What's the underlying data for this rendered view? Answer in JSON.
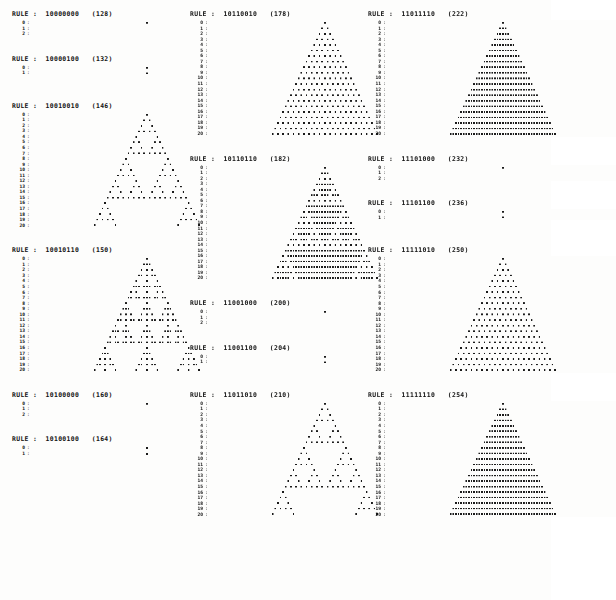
{
  "page": {
    "label_prefix": "RULE :",
    "background_color": "#fdfdfc",
    "cell_color": "#1a1a1a",
    "rows": 21,
    "row_labels": [
      "0",
      "1",
      "2",
      "3",
      "4",
      "5",
      "6",
      "7",
      "8",
      "9",
      "10",
      "11",
      "12",
      "13",
      "14",
      "15",
      "16",
      "17",
      "18",
      "19",
      "20"
    ],
    "gutter_separator": ":"
  },
  "columns": [
    {
      "name": "column-left",
      "blocks": [
        {
          "header": "RULE :  10000000   (128)",
          "binary": "10000000",
          "decimal": 128,
          "rows_shown": 3,
          "grid_width": 88,
          "cell_px": 2.6,
          "spacer_after": "md"
        },
        {
          "header": "RULE :  10000100   (132)",
          "binary": "10000100",
          "decimal": 132,
          "rows_shown": 2,
          "grid_width": 88,
          "cell_px": 2.6,
          "spacer_after": "lg"
        },
        {
          "header": "RULE :  10010010   (146)",
          "binary": "10010010",
          "decimal": 146,
          "rows_shown": 21,
          "grid_width": 88,
          "cell_px": 2.6,
          "spacer_after": "md"
        },
        {
          "header": "RULE :  10010110   (150)",
          "binary": "10010110",
          "decimal": 150,
          "rows_shown": 21,
          "grid_width": 88,
          "cell_px": 2.6,
          "spacer_after": "md"
        },
        {
          "header": "RULE :  10100000   (160)",
          "binary": "10100000",
          "decimal": 160,
          "rows_shown": 3,
          "grid_width": 88,
          "cell_px": 2.6,
          "spacer_after": "md"
        },
        {
          "header": "RULE :  10100100   (164)",
          "binary": "10100100",
          "decimal": 164,
          "rows_shown": 2,
          "grid_width": 88,
          "cell_px": 2.6,
          "spacer_after": "sm"
        }
      ]
    },
    {
      "name": "column-middle",
      "blocks": [
        {
          "header": "RULE :  10110010   (178)",
          "binary": "10110010",
          "decimal": 178,
          "rows_shown": 21,
          "grid_width": 88,
          "cell_px": 2.6,
          "spacer_after": "md"
        },
        {
          "header": "RULE :  10110110   (182)",
          "binary": "10110110",
          "decimal": 182,
          "rows_shown": 21,
          "grid_width": 88,
          "cell_px": 2.6,
          "spacer_after": "md"
        },
        {
          "header": "RULE :  11001000   (200)",
          "binary": "11001000",
          "decimal": 200,
          "rows_shown": 3,
          "grid_width": 88,
          "cell_px": 2.6,
          "spacer_after": "md"
        },
        {
          "header": "RULE :  11001100   (204)",
          "binary": "11001100",
          "decimal": 204,
          "rows_shown": 2,
          "grid_width": 88,
          "cell_px": 2.6,
          "spacer_after": "lg"
        },
        {
          "header": "RULE :  11011010   (210)",
          "binary": "11011010",
          "decimal": 210,
          "rows_shown": 21,
          "grid_width": 88,
          "cell_px": 2.6,
          "spacer_after": "sm"
        }
      ]
    },
    {
      "name": "column-right",
      "blocks": [
        {
          "header": "RULE :  11011110   (222)",
          "binary": "11011110",
          "decimal": 222,
          "rows_shown": 21,
          "grid_width": 88,
          "cell_px": 2.6,
          "spacer_after": "md"
        },
        {
          "header": "RULE :  11101000   (232)",
          "binary": "11101000",
          "decimal": 232,
          "rows_shown": 3,
          "grid_width": 88,
          "cell_px": 2.6,
          "spacer_after": "md"
        },
        {
          "header": "RULE :  11101100   (236)",
          "binary": "11101100",
          "decimal": 236,
          "rows_shown": 2,
          "grid_width": 88,
          "cell_px": 2.6,
          "spacer_after": "lg"
        },
        {
          "header": "RULE :  11111010   (250)",
          "binary": "11111010",
          "decimal": 250,
          "rows_shown": 21,
          "grid_width": 88,
          "cell_px": 2.6,
          "spacer_after": "md"
        },
        {
          "header": "RULE :  11111110   (254)",
          "binary": "11111110",
          "decimal": 254,
          "rows_shown": 21,
          "grid_width": 88,
          "cell_px": 2.6,
          "spacer_after": "sm"
        }
      ]
    }
  ]
}
